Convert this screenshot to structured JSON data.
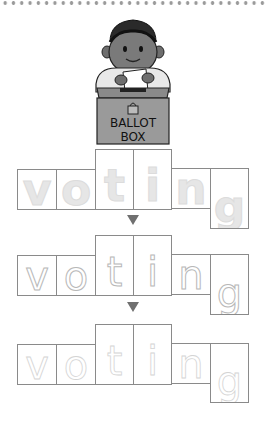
{
  "worksheet": {
    "word": "voting",
    "illustration": {
      "subject": "child casting ballot",
      "box_label_line1": "BALLOT",
      "box_label_line2": "BOX"
    },
    "rows": [
      {
        "style": "solid-faded",
        "letters": [
          "v",
          "o",
          "t",
          "i",
          "n",
          "g"
        ]
      },
      {
        "style": "dashed",
        "letters": [
          "v",
          "o",
          "t",
          "i",
          "n",
          "g"
        ]
      },
      {
        "style": "dotted",
        "letters": [
          "v",
          "o",
          "t",
          "i",
          "n",
          "g"
        ]
      }
    ],
    "arrow_icon": "down-triangle",
    "colors": {
      "box_border": "#8a8a8a",
      "arrow": "#707070",
      "dots": "#9a9a9a"
    }
  }
}
